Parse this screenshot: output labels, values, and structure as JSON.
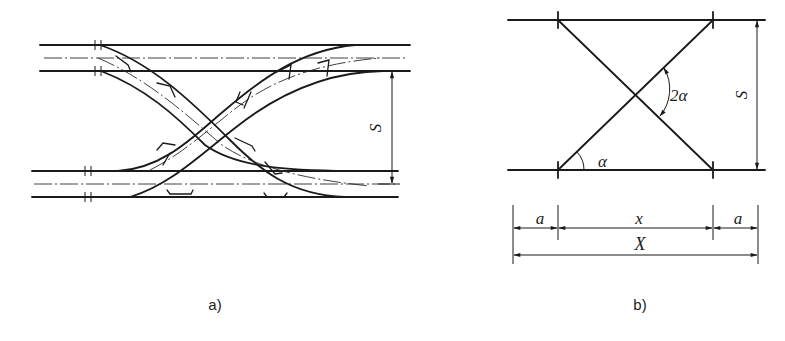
{
  "figure": {
    "panel_a": {
      "caption": "a)",
      "dimension_label": "S",
      "description": "Scissors crossover between two parallel double-rail tracks"
    },
    "panel_b": {
      "caption": "b)",
      "dimension_label_vertical": "S",
      "angle_label": "α",
      "crossing_angle_label": "2α",
      "dim_left": "a",
      "dim_middle": "x",
      "dim_right": "a",
      "dim_total": "X"
    }
  },
  "colors": {
    "line": "#1a1a1a",
    "background": "#ffffff"
  }
}
